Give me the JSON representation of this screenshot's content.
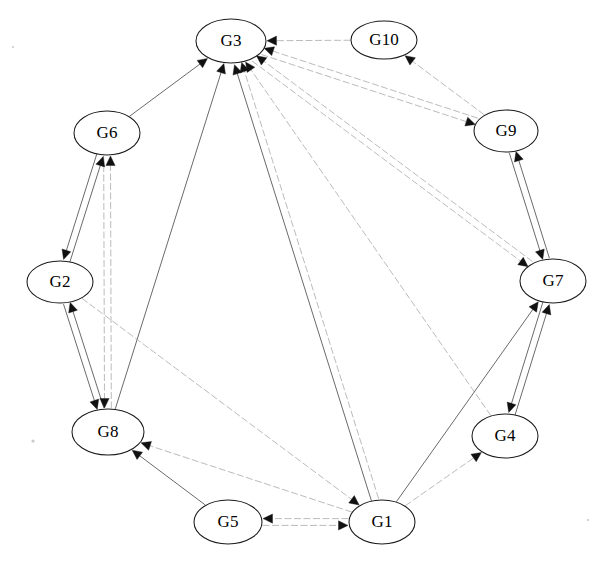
{
  "diagram": {
    "type": "directed-graph",
    "title": "",
    "background_color": "#ffffff",
    "node_fill": "#ffffff",
    "node_stroke": "#1a1a1a",
    "edge_color": "#6f6f6f",
    "arrow_color": "#111111",
    "node_count": 10,
    "edge_count": 25,
    "layout": "circular",
    "nodes": [
      {
        "id": "G3",
        "label": "G3",
        "cx": 231,
        "cy": 41,
        "rx": 35,
        "ry": 22
      },
      {
        "id": "G10",
        "label": "G10",
        "cx": 384,
        "cy": 40,
        "rx": 33,
        "ry": 19
      },
      {
        "id": "G9",
        "label": "G9",
        "cx": 506,
        "cy": 131,
        "rx": 32,
        "ry": 21
      },
      {
        "id": "G7",
        "label": "G7",
        "cx": 553,
        "cy": 281,
        "rx": 33,
        "ry": 22
      },
      {
        "id": "G4",
        "label": "G4",
        "cx": 505,
        "cy": 436,
        "rx": 33,
        "ry": 22
      },
      {
        "id": "G1",
        "label": "G1",
        "cx": 382,
        "cy": 522,
        "rx": 33,
        "ry": 22
      },
      {
        "id": "G5",
        "label": "G5",
        "cx": 228,
        "cy": 522,
        "rx": 34,
        "ry": 22
      },
      {
        "id": "G8",
        "label": "G8",
        "cx": 108,
        "cy": 432,
        "rx": 36,
        "ry": 23
      },
      {
        "id": "G2",
        "label": "G2",
        "cx": 60,
        "cy": 282,
        "rx": 33,
        "ry": 21
      },
      {
        "id": "G6",
        "label": "G6",
        "cx": 107,
        "cy": 133,
        "rx": 33,
        "ry": 22
      }
    ],
    "edges": [
      {
        "from": "G6",
        "to": "G3",
        "style": "solid"
      },
      {
        "from": "G8",
        "to": "G3",
        "style": "solid"
      },
      {
        "from": "G1",
        "to": "G3",
        "style": "solid"
      },
      {
        "from": "G10",
        "to": "G3",
        "style": "dashed"
      },
      {
        "from": "G9",
        "to": "G3",
        "style": "dashed"
      },
      {
        "from": "G7",
        "to": "G3",
        "style": "dashed"
      },
      {
        "from": "G4",
        "to": "G3",
        "style": "dashed"
      },
      {
        "from": "G1",
        "to": "G3",
        "style": "dashed"
      },
      {
        "from": "G3",
        "to": "G9",
        "style": "dashed"
      },
      {
        "from": "G9",
        "to": "G10",
        "style": "dashed"
      },
      {
        "from": "G9",
        "to": "G7",
        "style": "solid"
      },
      {
        "from": "G7",
        "to": "G9",
        "style": "solid"
      },
      {
        "from": "G3",
        "to": "G7",
        "style": "dashed"
      },
      {
        "from": "G1",
        "to": "G7",
        "style": "solid"
      },
      {
        "from": "G4",
        "to": "G7",
        "style": "solid"
      },
      {
        "from": "G7",
        "to": "G4",
        "style": "solid"
      },
      {
        "from": "G1",
        "to": "G4",
        "style": "dashed"
      },
      {
        "from": "G2",
        "to": "G6",
        "style": "solid"
      },
      {
        "from": "G6",
        "to": "G2",
        "style": "solid"
      },
      {
        "from": "G8",
        "to": "G6",
        "style": "dashed"
      },
      {
        "from": "G8",
        "to": "G2",
        "style": "solid"
      },
      {
        "from": "G2",
        "to": "G8",
        "style": "solid"
      },
      {
        "from": "G6",
        "to": "G8",
        "style": "dashed"
      },
      {
        "from": "G5",
        "to": "G8",
        "style": "solid"
      },
      {
        "from": "G1",
        "to": "G8",
        "style": "dashed"
      },
      {
        "from": "G5",
        "to": "G1",
        "style": "dashed"
      },
      {
        "from": "G1",
        "to": "G5",
        "style": "dashed"
      },
      {
        "from": "G2",
        "to": "G1",
        "style": "dashed"
      }
    ]
  }
}
